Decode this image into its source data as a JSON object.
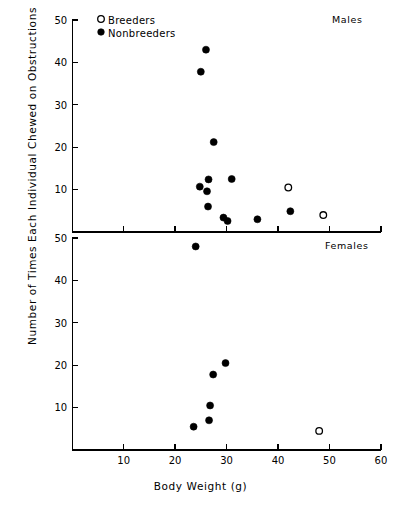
{
  "figure": {
    "ylabel": "Number of Times Each Individual Chewed on Obstructions",
    "xlabel": "Body Weight (g)"
  },
  "legend": {
    "breeders": "Breeders",
    "nonbreeders": "Nonbreeders"
  },
  "panels": {
    "top_label": "Males",
    "bottom_label": "Females"
  },
  "axis": {
    "x_ticks": [
      "10",
      "20",
      "30",
      "40",
      "50",
      "60"
    ],
    "y_ticks_top": [
      "50",
      "40",
      "30",
      "20",
      "10"
    ],
    "y_ticks_bottom": [
      "50",
      "40",
      "30",
      "20",
      "10"
    ]
  },
  "chart_data": {
    "type": "scatter",
    "title": "",
    "xlabel": "Body Weight (g)",
    "ylabel": "Number of Times Each Individual Chewed on Obstructions",
    "xlim": [
      0,
      60
    ],
    "ylim": [
      0,
      50
    ],
    "xticks": [
      10,
      20,
      30,
      40,
      50,
      60
    ],
    "yticks": [
      10,
      20,
      30,
      40,
      50
    ],
    "grid": false,
    "legend_position": "top-left",
    "panels": [
      {
        "name": "Males",
        "series": [
          {
            "name": "Nonbreeders",
            "marker": "filled-circle",
            "points": [
              [
                26.0,
                43.0
              ],
              [
                25.0,
                37.8
              ],
              [
                27.5,
                21.2
              ],
              [
                26.5,
                12.4
              ],
              [
                24.8,
                10.7
              ],
              [
                26.2,
                9.6
              ],
              [
                26.4,
                6.0
              ],
              [
                31.0,
                12.5
              ],
              [
                29.4,
                3.4
              ],
              [
                30.2,
                2.6
              ],
              [
                36.0,
                3.0
              ],
              [
                42.4,
                4.9
              ]
            ]
          },
          {
            "name": "Breeders",
            "marker": "open-circle",
            "points": [
              [
                42.0,
                10.5
              ],
              [
                48.8,
                4.0
              ]
            ]
          }
        ]
      },
      {
        "name": "Females",
        "series": [
          {
            "name": "Nonbreeders",
            "marker": "filled-circle",
            "points": [
              [
                24.0,
                48.0
              ],
              [
                29.8,
                20.5
              ],
              [
                27.4,
                17.8
              ],
              [
                26.8,
                10.5
              ],
              [
                26.6,
                7.0
              ],
              [
                23.6,
                5.5
              ]
            ]
          },
          {
            "name": "Breeders",
            "marker": "open-circle",
            "points": [
              [
                48.0,
                4.5
              ]
            ]
          }
        ]
      }
    ]
  }
}
